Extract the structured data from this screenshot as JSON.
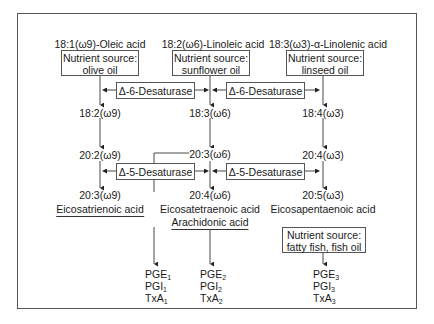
{
  "diagram": {
    "columns": [
      {
        "header": "18:1(ω9)-Oleic acid",
        "source_label": "Nutrient source:",
        "source_value": "olive oil",
        "step1": "18:2(ω9)",
        "step2": "20:2(ω9)",
        "step3": "20:3(ω9)",
        "product_name": "Eicosatrienoic acid",
        "eicosanoids": [
          {
            "base": "PGE",
            "sub": "1"
          },
          {
            "base": "PGI",
            "sub": "1"
          },
          {
            "base": "TxA",
            "sub": "1"
          }
        ]
      },
      {
        "header": "18:2(ω6)-Linoleic acid",
        "source_label": "Nutrient source:",
        "source_value": "sunflower oil",
        "step1": "18:3(ω6)",
        "step2": "20:3(ω6)",
        "step3": "20:4(ω6)",
        "product_name": "Eicosatetraenoic acid",
        "product_alt_name": "Arachidonic acid",
        "eicosanoids": [
          {
            "base": "PGE",
            "sub": "2"
          },
          {
            "base": "PGI",
            "sub": "2"
          },
          {
            "base": "TxA",
            "sub": "2"
          }
        ]
      },
      {
        "header": "18:3(ω3)-α-Linolenic acid",
        "source_label": "Nutrient source:",
        "source_value": "linseed oil",
        "step1": "18:4(ω3)",
        "step2": "20:4(ω3)",
        "step3": "20:5(ω3)",
        "product_name": "Eicosapentaenoic acid",
        "extra_source_label": "Nutrient source:",
        "extra_source_value": "fatty fish, fish oil",
        "eicosanoids": [
          {
            "base": "PGE",
            "sub": "3"
          },
          {
            "base": "PGI",
            "sub": "3"
          },
          {
            "base": "TxA",
            "sub": "3"
          }
        ]
      }
    ],
    "enzymes": {
      "delta6_left": "Δ-6-Desaturase",
      "delta6_right": "Δ-6-Desaturase",
      "delta5_left": "Δ-5-Desaturase",
      "delta5_right": "Δ-5-Desaturase"
    }
  }
}
